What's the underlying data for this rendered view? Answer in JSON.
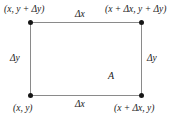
{
  "figure": {
    "type": "rectangle-region-diagram",
    "colors": {
      "edge": "#8a8a8a",
      "vertex": "#161616",
      "text": "#1a1a1a",
      "background": "#ffffff"
    },
    "vertices": [
      {
        "name": "top-left",
        "label": "(x, y + Δy)"
      },
      {
        "name": "top-right",
        "label": "(x + Δx, y + Δy)"
      },
      {
        "name": "bottom-left",
        "label": "(x, y)"
      },
      {
        "name": "bottom-right",
        "label": "(x + Δx, y)"
      }
    ],
    "edge_labels": {
      "top": "Δx",
      "bottom": "Δx",
      "left": "Δy",
      "right": "Δy"
    },
    "area_label": "A"
  }
}
